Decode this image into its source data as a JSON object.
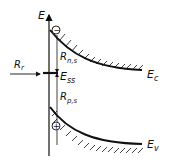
{
  "diagram": {
    "axis_label": "E",
    "conduction_band_label": "E",
    "conduction_band_sub": "c",
    "valence_band_label": "E",
    "valence_band_sub": "v",
    "surface_state_label": "E",
    "surface_state_sub": "ss",
    "electron_rate_label": "R",
    "electron_rate_sub": "n,s",
    "hole_rate_label": "R",
    "hole_rate_sub": "p,s",
    "recombination_label": "R",
    "recombination_sub": "r",
    "electron_symbol": "−",
    "hole_symbol": "+"
  }
}
